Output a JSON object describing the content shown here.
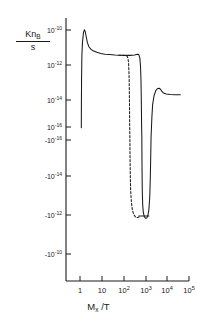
{
  "chart_data": {
    "type": "line",
    "title": "",
    "subtitle": "",
    "xlabel_main": "M",
    "xlabel_sub": "x",
    "xlabel_tail": " /T",
    "xlabel_full": "Mx /T",
    "ylabel_numerator_main": "Kn",
    "ylabel_numerator_sub": "B",
    "ylabel_denominator": "s",
    "ylabel_full": "KnB / s",
    "x_scale": "log",
    "y_scale": "symlog-signed-log",
    "xlim": [
      0.3,
      100000
    ],
    "xticks": [
      1,
      10,
      100,
      1000,
      10000,
      100000
    ],
    "xtick_labels": [
      "1",
      "10",
      "10",
      "10",
      "10",
      "10"
    ],
    "xtick_exponents": [
      "",
      "",
      "2",
      "3",
      "4",
      "5"
    ],
    "yticks_labels": [
      "10",
      "10",
      "10",
      "10",
      "-10",
      "-10",
      "-10"
    ],
    "yticks_exponents": [
      "-10",
      "-12",
      "-14",
      "-16",
      "-16",
      "-14",
      "-12"
    ],
    "ytick_texts": [
      "10^-10",
      "10^-12",
      "10^-14",
      "10^-16",
      "-10^-16",
      "-10^-14",
      "-10^-12",
      "-10^-10"
    ],
    "grid": false,
    "legend": false,
    "legend_position": "none",
    "axis_color": "#1a1a1a",
    "curve_color": "#1a1a1a",
    "series": [
      {
        "name": "solid-branch",
        "style": "solid",
        "points": [
          [
            1.15,
            -16.05
          ],
          [
            1.16,
            -14.6
          ],
          [
            1.18,
            -13.0
          ],
          [
            1.22,
            -11.6
          ],
          [
            1.3,
            -10.75
          ],
          [
            1.45,
            -10.15
          ],
          [
            1.6,
            -9.98
          ],
          [
            1.75,
            -10.12
          ],
          [
            1.95,
            -10.45
          ],
          [
            2.2,
            -10.8
          ],
          [
            2.6,
            -11.05
          ],
          [
            3.2,
            -11.2
          ],
          [
            4.2,
            -11.3
          ],
          [
            6.0,
            -11.38
          ],
          [
            9.0,
            -11.45
          ],
          [
            14.0,
            -11.5
          ],
          [
            22.0,
            -11.52
          ],
          [
            40.0,
            -11.55
          ],
          [
            70.0,
            -11.56
          ],
          [
            120.0,
            -11.57
          ],
          [
            200.0,
            -11.57
          ],
          [
            320.0,
            -11.55
          ],
          [
            430.0,
            -11.5
          ],
          [
            500.0,
            -11.52
          ],
          [
            560.0,
            -11.75
          ],
          [
            600.0,
            -12.3
          ],
          [
            630.0,
            -13.2
          ],
          [
            650.0,
            -14.4
          ],
          [
            665.0,
            -15.6
          ],
          [
            675.0,
            -16.2
          ],
          [
            685.0,
            16.2
          ],
          [
            700.0,
            14.6
          ],
          [
            720.0,
            13.3
          ],
          [
            750.0,
            12.6
          ],
          [
            800.0,
            12.2
          ],
          [
            880.0,
            11.98
          ],
          [
            1000.0,
            11.88
          ],
          [
            1150.0,
            11.9
          ],
          [
            1300.0,
            12.02
          ],
          [
            1450.0,
            12.35
          ],
          [
            1580.0,
            13.0
          ],
          [
            1680.0,
            14.0
          ],
          [
            1760.0,
            15.2
          ],
          [
            1820.0,
            16.2
          ],
          [
            1880.0,
            -16.2
          ],
          [
            1980.0,
            -15.4
          ],
          [
            2150.0,
            -14.6
          ],
          [
            2500.0,
            -14.05
          ],
          [
            3000.0,
            -13.75
          ],
          [
            3600.0,
            -13.62
          ],
          [
            4200.0,
            -13.6
          ],
          [
            4800.0,
            -13.65
          ],
          [
            5600.0,
            -13.78
          ],
          [
            6800.0,
            -13.9
          ],
          [
            9000.0,
            -13.96
          ],
          [
            14000.0,
            -13.99
          ],
          [
            22000.0,
            -14.0
          ],
          [
            40000.0,
            -14.01
          ]
        ]
      },
      {
        "name": "dashed-branch",
        "style": "dashed",
        "points": [
          [
            60.0,
            -11.56
          ],
          [
            90.0,
            -11.57
          ],
          [
            120.0,
            -11.58
          ],
          [
            145.0,
            -11.62
          ],
          [
            160.0,
            -11.75
          ],
          [
            170.0,
            -12.1
          ],
          [
            178.0,
            -12.8
          ],
          [
            183.0,
            -13.7
          ],
          [
            187.0,
            -14.8
          ],
          [
            190.0,
            -15.8
          ],
          [
            192.0,
            -16.2
          ],
          [
            194.0,
            16.2
          ],
          [
            197.0,
            15.2
          ],
          [
            202.0,
            14.2
          ],
          [
            210.0,
            13.4
          ],
          [
            225.0,
            12.8
          ],
          [
            250.0,
            12.35
          ],
          [
            290.0,
            12.08
          ],
          [
            350.0,
            11.95
          ],
          [
            430.0,
            11.92
          ],
          [
            520.0,
            11.95
          ],
          [
            600.0,
            12.0
          ]
        ]
      }
    ],
    "annotations": [
      {
        "name": "horizontal-marker",
        "type": "h-segment",
        "x_start": 480,
        "x_end": 1500,
        "y_level": 12.0,
        "sign": "negative"
      }
    ]
  }
}
